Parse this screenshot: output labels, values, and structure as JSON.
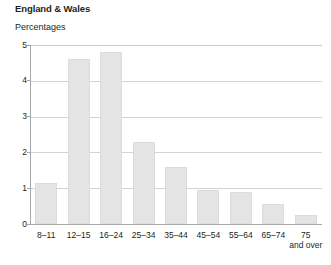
{
  "header": {
    "title": "England & Wales",
    "subtitle": "Percentages"
  },
  "chart_data": {
    "type": "bar",
    "title": "England & Wales",
    "subtitle": "Percentages",
    "xlabel": "",
    "ylabel": "Percentages",
    "ylim": [
      0,
      5
    ],
    "yticks": [
      "0",
      "1",
      "2",
      "3",
      "4",
      "5"
    ],
    "grid": true,
    "legend": false,
    "categories": [
      "8–11",
      "12–15",
      "16–24",
      "25–34",
      "35–44",
      "45–54",
      "55–64",
      "65–74",
      "75 and over"
    ],
    "category_lines": [
      [
        "8–11"
      ],
      [
        "12–15"
      ],
      [
        "16–24"
      ],
      [
        "25–34"
      ],
      [
        "35–44"
      ],
      [
        "45–54"
      ],
      [
        "55–64"
      ],
      [
        "65–74"
      ],
      [
        "75",
        "and over"
      ]
    ],
    "values": [
      1.15,
      4.6,
      4.8,
      2.3,
      1.6,
      0.95,
      0.9,
      0.55,
      0.25
    ],
    "bar_color": "#e4e4e4",
    "bar_border_color": "#dcdcdc",
    "grid_color": "#d2d2d2",
    "axis_color": "#a8a8a8"
  }
}
